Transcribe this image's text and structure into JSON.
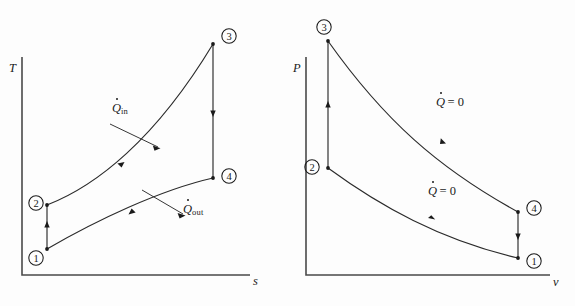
{
  "figure": {
    "type": "thermodynamic-cycle-diagram",
    "panels": [
      {
        "id": "ts",
        "name": "temperature-entropy-diagram",
        "y_axis_label": "T",
        "x_axis_label": "s",
        "states": [
          {
            "id": "1",
            "label": "1",
            "x": 47,
            "y": 249,
            "circle_x": 36,
            "circle_y": 258
          },
          {
            "id": "2",
            "label": "2",
            "x": 47,
            "y": 205,
            "circle_x": 36,
            "circle_y": 203
          },
          {
            "id": "3",
            "label": "3",
            "x": 213,
            "y": 44,
            "circle_x": 229,
            "circle_y": 36
          },
          {
            "id": "4",
            "label": "4",
            "x": 213,
            "y": 178,
            "circle_x": 229,
            "circle_y": 176
          }
        ],
        "processes": [
          {
            "from": "1",
            "to": "2",
            "kind": "isentropic-compression",
            "shape": "vertical-line"
          },
          {
            "from": "2",
            "to": "3",
            "kind": "heat-addition",
            "shape": "curve",
            "heat_label": "Q_in"
          },
          {
            "from": "3",
            "to": "4",
            "kind": "isentropic-expansion",
            "shape": "vertical-line"
          },
          {
            "from": "4",
            "to": "1",
            "kind": "heat-rejection",
            "shape": "curve",
            "heat_label": "Q_out"
          }
        ],
        "annotations": [
          {
            "name": "q-in-label",
            "symbol": "Q",
            "dot": true,
            "subscript": "in",
            "x": 112,
            "y": 108
          },
          {
            "name": "q-out-label",
            "symbol": "Q",
            "dot": true,
            "subscript": "out",
            "x": 183,
            "y": 208
          }
        ]
      },
      {
        "id": "pv",
        "name": "pressure-volume-diagram",
        "y_axis_label": "P",
        "x_axis_label": "v",
        "states": [
          {
            "id": "1",
            "label": "1",
            "x": 230,
            "y": 258,
            "circle_x": 246,
            "circle_y": 261
          },
          {
            "id": "2",
            "label": "2",
            "x": 40,
            "y": 168,
            "circle_x": 24,
            "circle_y": 167
          },
          {
            "id": "3",
            "label": "3",
            "x": 40,
            "y": 41,
            "circle_x": 36,
            "circle_y": 27
          },
          {
            "id": "4",
            "label": "4",
            "x": 230,
            "y": 212,
            "circle_x": 246,
            "circle_y": 208
          }
        ],
        "processes": [
          {
            "from": "1",
            "to": "2",
            "kind": "isentropic-compression",
            "shape": "curve",
            "heat_label": "Q = 0"
          },
          {
            "from": "2",
            "to": "3",
            "kind": "heat-addition",
            "shape": "vertical-line"
          },
          {
            "from": "3",
            "to": "4",
            "kind": "isentropic-expansion",
            "shape": "curve",
            "heat_label": "Q = 0"
          },
          {
            "from": "4",
            "to": "1",
            "kind": "heat-rejection",
            "shape": "vertical-line"
          }
        ],
        "annotations": [
          {
            "name": "q-zero-upper-label",
            "symbol": "Q",
            "dot": true,
            "equals": "= 0",
            "x": 148,
            "y": 103
          },
          {
            "name": "q-zero-lower-label",
            "symbol": "Q",
            "dot": true,
            "equals": "= 0",
            "x": 140,
            "y": 192
          }
        ]
      }
    ],
    "labels": {
      "q_in": {
        "symbol": "Q",
        "subscript": "in"
      },
      "q_out": {
        "symbol": "Q",
        "subscript": "out"
      },
      "q_zero": {
        "symbol": "Q",
        "equals": "= 0"
      },
      "axis_T": "T",
      "axis_s": "s",
      "axis_P": "P",
      "axis_v": "v",
      "state_1": "1",
      "state_2": "2",
      "state_3": "3",
      "state_4": "4"
    },
    "colors": {
      "background": "#fdfdfd",
      "ink": "#1a1a1a",
      "axis": "#4a4a4a"
    }
  }
}
